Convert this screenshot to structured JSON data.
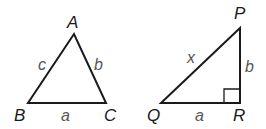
{
  "triangles": [
    {
      "name": "ABC",
      "vertices": {
        "A": "A",
        "B": "B",
        "C": "C"
      },
      "sides": {
        "a": "a",
        "b": "b",
        "c": "c"
      }
    },
    {
      "name": "PQR",
      "right_angle_at": "R",
      "vertices": {
        "P": "P",
        "Q": "Q",
        "R": "R"
      },
      "sides": {
        "x": "x",
        "a": "a",
        "b": "b"
      }
    }
  ],
  "colors": {
    "stroke": "#1a1a1a",
    "side_label": "#555555",
    "vertex_label": "#1a1a1a"
  }
}
